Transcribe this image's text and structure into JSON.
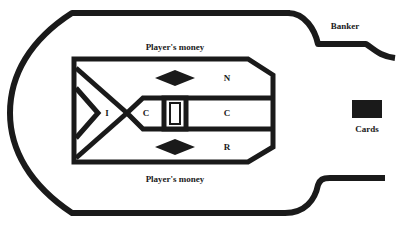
{
  "diagram": {
    "colors": {
      "ink": "#1a1a1a",
      "background": "#ffffff"
    },
    "labels": {
      "banker": "Banker",
      "players_money_top": "Player's money",
      "players_money_bottom": "Player's money",
      "cards": "Cards",
      "zone_i": "I",
      "zone_c_left": "C",
      "zone_n": "N",
      "zone_c_right": "C",
      "zone_r": "R"
    },
    "shapes": {
      "diamond_top": "diamond",
      "diamond_bottom": "diamond",
      "cards_box": "filled-rectangle",
      "center_box": "nested-rectangle"
    }
  }
}
